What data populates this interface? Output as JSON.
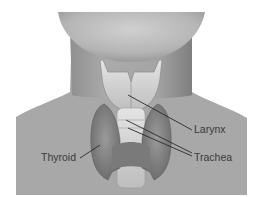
{
  "figure": {
    "colors": {
      "background": "#ffffff",
      "skin": "#a9a9a9",
      "chin": "#c4c4c4",
      "neck_shadow": "#8a8a8a",
      "larynx": "#d8d8d8",
      "thyroid": "#7e7e7e",
      "trachea": "#cfcfcf",
      "leader_line": "#2a2a2a",
      "label_text": "#3a3a3a"
    },
    "labels": {
      "larynx": "Larynx",
      "trachea": "Trachea",
      "thyroid": "Thyroid"
    }
  }
}
